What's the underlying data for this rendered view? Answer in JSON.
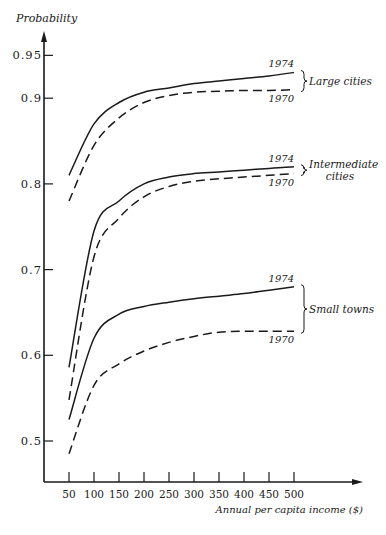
{
  "chart_data": {
    "type": "line",
    "title": "",
    "xlabel": "Annual per capita income ($)",
    "ylabel": "Probability",
    "xlim": [
      0,
      560
    ],
    "ylim": [
      0.45,
      0.97
    ],
    "x": [
      50,
      100,
      150,
      200,
      250,
      300,
      350,
      400,
      450,
      500
    ],
    "x_ticks": [
      "50",
      "100",
      "150",
      "200",
      "250",
      "300",
      "350",
      "400",
      "450",
      "500"
    ],
    "y_ticks": [
      {
        "value": 0.95,
        "label": "0.95"
      },
      {
        "value": 0.9,
        "label": "0.9"
      },
      {
        "value": 0.8,
        "label": "0.8"
      },
      {
        "value": 0.7,
        "label": "0.7"
      },
      {
        "value": 0.6,
        "label": "0.6"
      },
      {
        "value": 0.5,
        "label": "0.5"
      }
    ],
    "grid": false,
    "series": [
      {
        "name": "Large cities 1974",
        "group": "Large cities",
        "year": "1974",
        "style": "solid",
        "values": [
          0.81,
          0.87,
          0.895,
          0.907,
          0.912,
          0.917,
          0.92,
          0.923,
          0.926,
          0.93
        ]
      },
      {
        "name": "Large cities 1970",
        "group": "Large cities",
        "year": "1970",
        "style": "dashed",
        "values": [
          0.78,
          0.845,
          0.877,
          0.895,
          0.903,
          0.907,
          0.908,
          0.909,
          0.909,
          0.91
        ]
      },
      {
        "name": "Intermediate cities 1974",
        "group": "Intermediate cities",
        "year": "1974",
        "style": "solid",
        "values": [
          0.586,
          0.745,
          0.78,
          0.8,
          0.808,
          0.812,
          0.814,
          0.816,
          0.818,
          0.82
        ]
      },
      {
        "name": "Intermediate cities 1970",
        "group": "Intermediate cities",
        "year": "1970",
        "style": "dashed",
        "values": [
          0.548,
          0.715,
          0.76,
          0.785,
          0.797,
          0.803,
          0.806,
          0.808,
          0.81,
          0.812
        ]
      },
      {
        "name": "Small towns 1974",
        "group": "Small towns",
        "year": "1974",
        "style": "solid",
        "values": [
          0.525,
          0.62,
          0.648,
          0.657,
          0.662,
          0.666,
          0.669,
          0.672,
          0.676,
          0.68
        ]
      },
      {
        "name": "Small towns 1970",
        "group": "Small towns",
        "year": "1970",
        "style": "dashed",
        "values": [
          0.485,
          0.565,
          0.59,
          0.605,
          0.615,
          0.622,
          0.627,
          0.628,
          0.628,
          0.628
        ]
      }
    ],
    "annotations": [
      {
        "group": "Large cities",
        "lines": [
          "Large cities"
        ],
        "top_label": "1974",
        "bottom_label": "1970"
      },
      {
        "group": "Intermediate cities",
        "lines": [
          "Intermediate",
          "cities"
        ],
        "top_label": "1974",
        "bottom_label": "1970"
      },
      {
        "group": "Small towns",
        "lines": [
          "Small towns"
        ],
        "top_label": "1974",
        "bottom_label": "1970"
      }
    ],
    "legend_position": "inline-right"
  }
}
